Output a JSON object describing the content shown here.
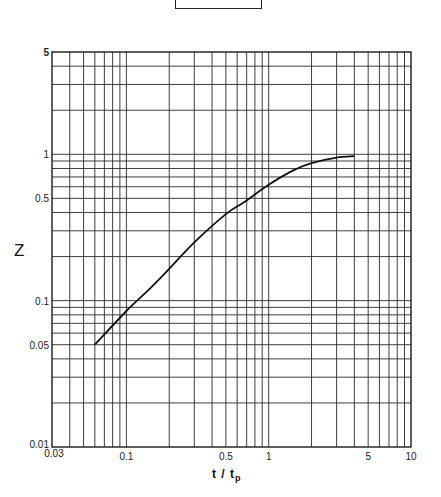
{
  "chart_data": {
    "type": "line",
    "title": "",
    "xlabel": "t / t_p",
    "xlabel_main": "t / t",
    "xlabel_sub": "p",
    "ylabel": "Z",
    "xscale": "log",
    "yscale": "log",
    "xlim": [
      0.03,
      10
    ],
    "ylim": [
      0.01,
      5
    ],
    "grid": true,
    "legend": null,
    "x_ticks": [
      {
        "value": 0.03,
        "label": "0.03"
      },
      {
        "value": 0.1,
        "label": "0.1"
      },
      {
        "value": 0.5,
        "label": "0.5"
      },
      {
        "value": 1,
        "label": "1"
      },
      {
        "value": 5,
        "label": "5"
      },
      {
        "value": 10,
        "label": "10"
      }
    ],
    "y_ticks": [
      {
        "value": 0.01,
        "label": "0.01"
      },
      {
        "value": 0.05,
        "label": "0.05"
      },
      {
        "value": 0.1,
        "label": "0.1"
      },
      {
        "value": 0.5,
        "label": "0.5"
      },
      {
        "value": 1,
        "label": "1"
      },
      {
        "value": 5,
        "label": "5"
      }
    ],
    "x_gridlines": [
      0.04,
      0.05,
      0.06,
      0.07,
      0.08,
      0.09,
      0.1,
      0.2,
      0.3,
      0.4,
      0.5,
      0.6,
      0.7,
      0.8,
      0.9,
      1,
      2,
      3,
      4,
      5,
      6,
      7,
      8,
      9
    ],
    "y_gridlines": [
      0.02,
      0.03,
      0.04,
      0.05,
      0.06,
      0.07,
      0.08,
      0.09,
      0.1,
      0.2,
      0.3,
      0.4,
      0.5,
      0.6,
      0.7,
      0.8,
      0.9,
      1,
      2,
      3,
      4
    ],
    "series": [
      {
        "name": "Z",
        "x": [
          0.06,
          0.1,
          0.145,
          0.2,
          0.3,
          0.5,
          0.67,
          1.0,
          1.5,
          2.0,
          3.0,
          4.0
        ],
        "y": [
          0.05,
          0.085,
          0.12,
          0.165,
          0.25,
          0.39,
          0.47,
          0.62,
          0.78,
          0.87,
          0.95,
          0.97
        ]
      }
    ]
  },
  "colors": {
    "ink": "#1a1a1a",
    "grid": "#2a2a2a",
    "background": "#ffffff"
  }
}
